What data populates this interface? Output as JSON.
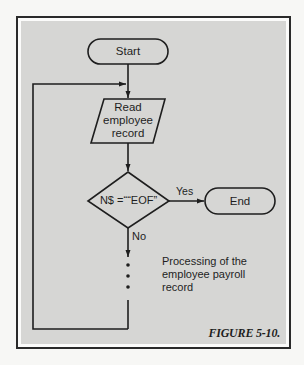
{
  "figure": {
    "caption": "FIGURE 5-10.",
    "background_color": "#d6d6d4",
    "border_color": "#2a2a2a"
  },
  "flowchart": {
    "start": {
      "label": "Start",
      "shape": "terminal"
    },
    "read": {
      "line1": "Read",
      "line2": "employee",
      "line3": "record",
      "shape": "parallelogram"
    },
    "decision": {
      "label": "N$ =““EOF”",
      "shape": "diamond"
    },
    "yes_label": "Yes",
    "no_label": "No",
    "end": {
      "label": "End",
      "shape": "terminal"
    },
    "process_note": {
      "line1": "Processing of the",
      "line2": "employee payroll",
      "line3": "record"
    },
    "loop": "back to read step"
  }
}
